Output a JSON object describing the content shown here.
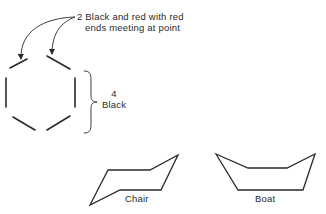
{
  "annotations": {
    "red_bonds": {
      "count": "2",
      "line1": "Black and red with red",
      "line2": "ends meeting at point"
    },
    "black_bonds": {
      "count": "4",
      "label": "Black"
    }
  },
  "conformations": [
    {
      "name": "chair",
      "label": "Chair"
    },
    {
      "name": "boat",
      "label": "Boat"
    }
  ],
  "colors": {
    "stroke": "#2a2a2a",
    "background": "#ffffff"
  }
}
